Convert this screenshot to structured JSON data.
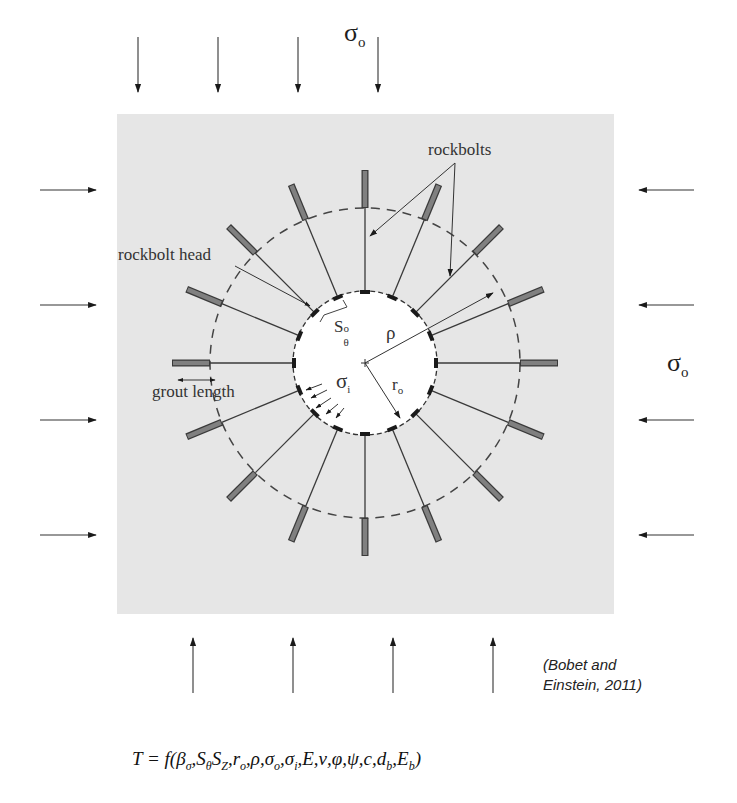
{
  "diagram": {
    "title_far_field_top": "σ",
    "title_far_field_top_sub": "o",
    "far_field_right": "σ",
    "far_field_right_sub": "o",
    "labels": {
      "rockbolts": "rockbolts",
      "rockbolt_head": "rockbolt head",
      "grout_length": "grout length",
      "s_theta": "S",
      "s_theta_sub": "θ",
      "s_theta_sup": "o",
      "rho": "ρ",
      "sigma_i": "σ",
      "sigma_i_sub": "i",
      "r_o": "r",
      "r_o_sub": "o"
    },
    "citation_line1": "(Bobet and",
    "citation_line2": "Einstein, 2011)",
    "equation": {
      "lhs": "T = f(",
      "args": "β",
      "full_text": "T = f(βσ, SθSZ, ro, ρ, σo, σi, E, ν, φ, ψ, c, db, Eb)"
    },
    "geometry": {
      "background_box": {
        "x": 117,
        "y": 114,
        "width": 497,
        "height": 500,
        "color": "#e6e6e6"
      },
      "tunnel_center": {
        "x": 365,
        "y": 363
      },
      "tunnel_radius": 72,
      "dashed_circle_radius": 155,
      "bolt_count": 16,
      "bolt_outer_radius": 193,
      "grout_start_radius": 155,
      "bolt_color": "#808080",
      "line_color": "#3a3a3a"
    },
    "arrows": {
      "top_x": [
        138,
        218,
        298,
        378
      ],
      "bottom_x": [
        193,
        293,
        393,
        493
      ],
      "left_y": [
        190,
        305,
        420,
        535
      ],
      "right_y": [
        190,
        305,
        420,
        535
      ]
    }
  }
}
